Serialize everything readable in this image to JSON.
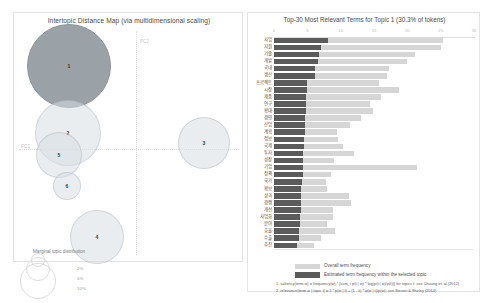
{
  "left_panel": {
    "title": "Intertopic Distance Map (via multidimensional scaling)",
    "axis_x_label": "PC1",
    "axis_y_label": "PC2",
    "marginal_legend_title": "Marginal topic distribution",
    "marginal_percents": [
      "2%",
      "5%",
      "10%"
    ],
    "selected_color": "#9aa1a7",
    "bubble_color": "#d7dee4",
    "topics": [
      {
        "label": "1",
        "cx": 55,
        "cy": 53,
        "r": 42,
        "selected": true
      },
      {
        "label": "2",
        "cx": 54,
        "cy": 120,
        "r": 33,
        "selected": false
      },
      {
        "label": "3",
        "cx": 190,
        "cy": 130,
        "r": 26,
        "selected": false
      },
      {
        "label": "4",
        "cx": 83,
        "cy": 224,
        "r": 27,
        "selected": false
      },
      {
        "label": "5",
        "cx": 45,
        "cy": 142,
        "r": 23,
        "selected": false
      },
      {
        "label": "6",
        "cx": 53,
        "cy": 173,
        "r": 14,
        "selected": false
      }
    ]
  },
  "right_panel": {
    "title": "Top-30 Most Relevant Terms for Topic 1 (30.3% of tokens)",
    "topic_number": 1,
    "topic_token_share": "30.3%",
    "x_axis": {
      "min": 0,
      "max": 30,
      "ticks": [
        0,
        5,
        10,
        15,
        20,
        25,
        30
      ],
      "tick_labels": [
        "0",
        "5",
        "10",
        "15",
        "20",
        "25",
        "30"
      ]
    },
    "legend": [
      {
        "name": "overall-term-frequency",
        "label": "Overall term frequency",
        "color": "#d6d6d6"
      },
      {
        "name": "estimated-term-frequency",
        "label": "Estimated term frequency within the selected topic",
        "color": "#5b5b5b"
      }
    ],
    "footnotes": [
      "1. saliency(term w) = frequency(w) * [sum_t p(t | w) * log(p(t | w)/p(t))] for topics t; see Chuang et. al (2012)",
      "2. relevance(term w | topic t) = λ * p(w | t) + (1 - λ) * p(w | t)/p(w); see Sievert & Shirley (2014)"
    ]
  },
  "chart_data": {
    "type": "bar",
    "title": "Top-30 Most Relevant Terms for Topic 1 (30.3% of tokens)",
    "xlabel": "",
    "ylabel": "",
    "xlim": [
      0,
      30
    ],
    "grid": false,
    "legend_position": "bottom-left",
    "orientation": "horizontal",
    "categories": [
      "사업",
      "지원",
      "기술",
      "개발",
      "국내",
      "생산",
      "프로젝트",
      "시장",
      "제품",
      "연구",
      "확대",
      "경영",
      "산업",
      "계획",
      "정보",
      "국제",
      "투자",
      "성장",
      "기업",
      "정책",
      "국가",
      "확보",
      "성과",
      "경쟁",
      "개선",
      "사업화",
      "분야",
      "효율",
      "수출",
      "추진"
    ],
    "series": [
      {
        "name": "Overall term frequency",
        "color": "#d6d6d6",
        "values": [
          25.4,
          25.0,
          21.2,
          20.0,
          17.3,
          17.0,
          15.7,
          18.7,
          16.1,
          14.4,
          14.8,
          13.0,
          11.4,
          9.4,
          9.6,
          10.3,
          12.0,
          9.0,
          21.5,
          8.6,
          7.8,
          8.0,
          11.2,
          11.6,
          8.9,
          8.8,
          8.0,
          9.1,
          7.1,
          6.0
        ]
      },
      {
        "name": "Estimated term frequency within the selected topic",
        "color": "#5b5b5b",
        "values": [
          8.1,
          7.1,
          6.8,
          6.6,
          6.2,
          6.1,
          4.9,
          4.9,
          4.8,
          4.8,
          4.8,
          4.7,
          4.7,
          4.6,
          4.5,
          4.5,
          4.4,
          4.4,
          4.3,
          4.3,
          4.2,
          4.1,
          4.1,
          4.0,
          4.0,
          3.9,
          3.9,
          3.8,
          3.7,
          3.5
        ]
      }
    ]
  }
}
